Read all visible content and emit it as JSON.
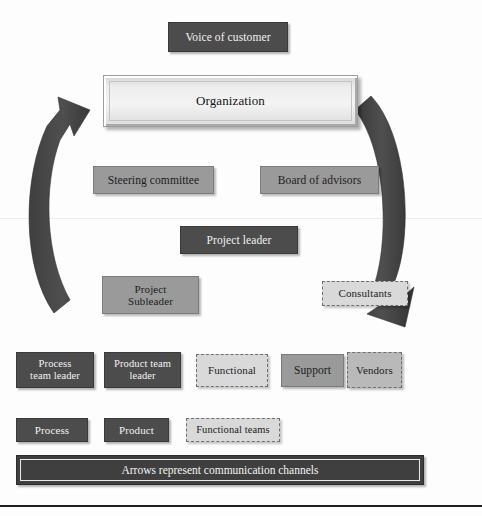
{
  "diagram": {
    "background_color": "#ffffff",
    "colors": {
      "dark_box": "#4c4c4c",
      "mid_box": "#9a9a9a",
      "light_dashed_box": "#d9d9d9",
      "vendors_box": "#b9b9b9",
      "arrow": "#4a4a4a",
      "banner": "#3f3f3f",
      "text_light": "#f2f2f2",
      "text_dark": "#1c1c1c"
    },
    "nodes": {
      "voice_of_customer": "Voice of customer",
      "organization": "Organization",
      "steering_committee": "Steering committee",
      "board_of_advisors": "Board of advisors",
      "project_leader": "Project leader",
      "project_subleader": "Project\nSubleader",
      "consultants": "Consultants",
      "process_team_leader": "Process\nteam leader",
      "product_team_leader": "Product team\nleader",
      "functional": "Functional",
      "support": "Support",
      "vendors": "Vendors"
    },
    "legend": {
      "process": "Process",
      "product": "Product",
      "functional_teams": "Functional teams"
    },
    "banner": {
      "text": "Arrows represent communication channels"
    },
    "arrows": [
      {
        "name": "left-feedback-arrow",
        "direction": "upward",
        "description": "curved arrow on the left sweeping up toward the Organization bar"
      },
      {
        "name": "right-deployment-arrow",
        "direction": "downward",
        "description": "curved arrow on the right sweeping down toward the Consultants/Vendors row"
      }
    ]
  }
}
